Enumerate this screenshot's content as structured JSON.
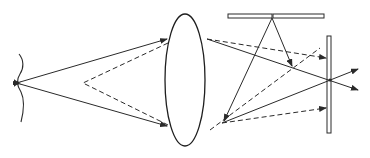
{
  "diagram": {
    "type": "optics-ray-diagram",
    "colors": {
      "line": "#2a2a2a",
      "background": "#ffffff"
    },
    "elements": {
      "wavefront": {
        "label": ""
      },
      "lens": {
        "label": ""
      },
      "top_mirror": {
        "label": ""
      },
      "right_mirror": {
        "label": ""
      }
    },
    "ray_styles": [
      "solid",
      "dashed"
    ]
  }
}
